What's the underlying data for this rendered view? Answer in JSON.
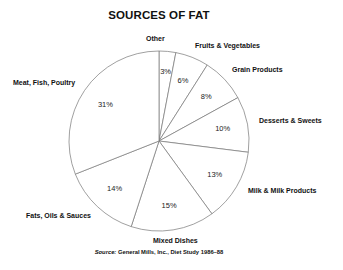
{
  "chart_data": {
    "type": "pie",
    "title": "SOURCES OF FAT",
    "start_angle": "12 o'clock",
    "direction": "clockwise",
    "categories": [
      "Other",
      "Fruits & Vegetables",
      "Grain Products",
      "Desserts & Sweets",
      "Milk & Milk Products",
      "Mixed Dishes",
      "Fats, Oils & Sauces",
      "Meat, Fish, Poultry"
    ],
    "values": [
      3,
      6,
      8,
      10,
      13,
      15,
      14,
      31
    ],
    "value_labels": [
      "3%",
      "6%",
      "8%",
      "10%",
      "13%",
      "15%",
      "14%",
      "31%"
    ],
    "unit": "%",
    "source_prefix": "Source:",
    "source": "General Mills, Inc., Diet Study 1986–88"
  },
  "style": {
    "fill": "#ffffff",
    "stroke": "#777777"
  }
}
